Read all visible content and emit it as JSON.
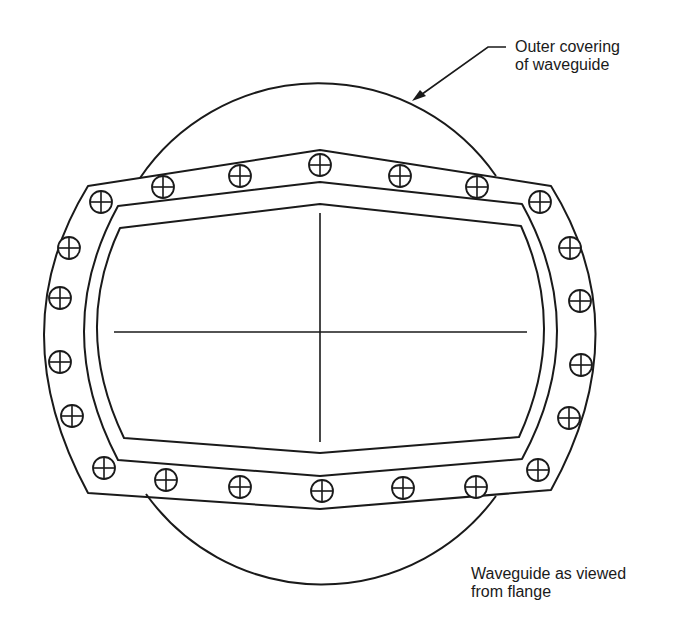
{
  "labels": {
    "outer_covering_line1": "Outer covering",
    "outer_covering_line2": "of waveguide",
    "caption_line1": "Waveguide as viewed",
    "caption_line2": "from flange"
  },
  "colors": {
    "line": "#1a1a1a",
    "background": "#ffffff"
  },
  "components": {
    "outer_covering": "circle",
    "flange": "bolted flange plate",
    "bolt_count": 20,
    "waveguide_opening": "curved rectangular aperture with center cross-lines"
  }
}
